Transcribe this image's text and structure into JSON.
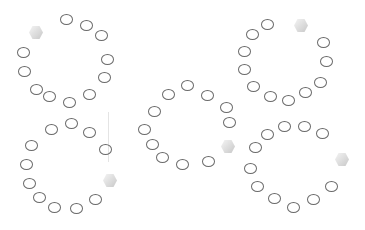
{
  "scene": {
    "width": 365,
    "height": 230,
    "background": "#ffffff",
    "ring_color": "#6a6a6a",
    "hex_color": "#dcdcdc"
  },
  "groups": [
    {
      "name": "top-left-circle",
      "rings": [
        [
          67,
          20
        ],
        [
          87,
          26
        ],
        [
          102,
          36
        ],
        [
          108,
          60
        ],
        [
          105,
          78
        ],
        [
          90,
          95
        ],
        [
          70,
          103
        ],
        [
          50,
          97
        ],
        [
          37,
          90
        ],
        [
          25,
          72
        ],
        [
          24,
          53
        ]
      ],
      "hex": [
        36,
        32
      ]
    },
    {
      "name": "bottom-left-circle",
      "rings": [
        [
          72,
          124
        ],
        [
          52,
          130
        ],
        [
          90,
          133
        ],
        [
          106,
          150
        ],
        [
          32,
          146
        ],
        [
          27,
          165
        ],
        [
          30,
          184
        ],
        [
          40,
          198
        ],
        [
          55,
          208
        ],
        [
          77,
          209
        ],
        [
          96,
          200
        ]
      ],
      "hex": [
        110,
        180
      ]
    },
    {
      "name": "center-circle",
      "rings": [
        [
          188,
          86
        ],
        [
          169,
          95
        ],
        [
          208,
          96
        ],
        [
          155,
          112
        ],
        [
          227,
          108
        ],
        [
          230,
          123
        ],
        [
          145,
          130
        ],
        [
          153,
          145
        ],
        [
          163,
          158
        ],
        [
          183,
          165
        ],
        [
          209,
          162
        ]
      ],
      "hex": [
        228,
        146
      ]
    },
    {
      "name": "top-right-circle",
      "rings": [
        [
          268,
          25
        ],
        [
          253,
          35
        ],
        [
          245,
          52
        ],
        [
          245,
          70
        ],
        [
          254,
          87
        ],
        [
          271,
          97
        ],
        [
          289,
          101
        ],
        [
          306,
          93
        ],
        [
          321,
          83
        ],
        [
          327,
          62
        ],
        [
          324,
          43
        ]
      ],
      "hex": [
        301,
        25
      ]
    },
    {
      "name": "bottom-right-circle",
      "rings": [
        [
          285,
          127
        ],
        [
          305,
          127
        ],
        [
          323,
          134
        ],
        [
          268,
          135
        ],
        [
          256,
          148
        ],
        [
          251,
          169
        ],
        [
          258,
          187
        ],
        [
          275,
          199
        ],
        [
          294,
          208
        ],
        [
          314,
          200
        ],
        [
          332,
          187
        ]
      ],
      "hex": [
        342,
        159
      ]
    }
  ]
}
